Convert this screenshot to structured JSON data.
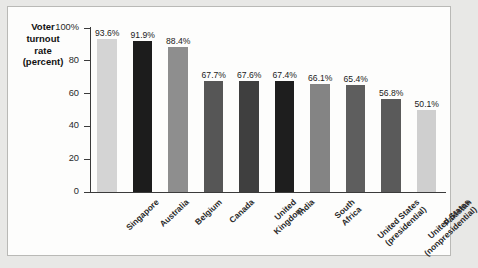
{
  "chart_data": {
    "type": "bar",
    "title": "",
    "ylabel": "Voter turnout rate (percent)",
    "ylabel_lines": [
      "Voter",
      "turnout",
      "rate",
      "(percent)"
    ],
    "xlabel": "",
    "ylim": [
      0,
      100
    ],
    "ytick_labels": [
      "100%",
      "80",
      "60",
      "40",
      "20",
      "0"
    ],
    "ytick_values": [
      100,
      80,
      60,
      40,
      20,
      0
    ],
    "grid": false,
    "legend": "none",
    "categories": [
      "Singapore",
      "Australia",
      "Belgium",
      "Canada",
      "United Kingdom",
      "India",
      "South Africa",
      "United States (presidential)",
      "United States (nonpresidential)",
      "Pakistan"
    ],
    "category_label_lines": [
      [
        "Singapore"
      ],
      [
        "Australia"
      ],
      [
        "Belgium"
      ],
      [
        "Canada"
      ],
      [
        "United",
        "Kingdom"
      ],
      [
        "India"
      ],
      [
        "South",
        "Africa"
      ],
      [
        "United States",
        "(presidential)"
      ],
      [
        "United States",
        "(nonpresidential)"
      ],
      [
        "Pakistan"
      ]
    ],
    "values": [
      93.6,
      91.9,
      88.4,
      67.7,
      67.6,
      67.4,
      66.1,
      65.4,
      56.8,
      50.1
    ],
    "value_labels": [
      "93.6%",
      "91.9%",
      "88.4%",
      "67.7%",
      "67.6%",
      "67.4%",
      "66.1%",
      "65.4%",
      "56.8%",
      "50.1%"
    ],
    "bar_colors": [
      "#d4d4d4",
      "#1c1c1c",
      "#8e8e8e",
      "#565656",
      "#3f3f3f",
      "#1e1e1e",
      "#848484",
      "#5e5e5e",
      "#5a5a5a",
      "#cfcfcf"
    ],
    "axis_color": "#3b3b3b",
    "background_color": "#fdfdfc",
    "page_background_color": "#e8e8e6"
  }
}
